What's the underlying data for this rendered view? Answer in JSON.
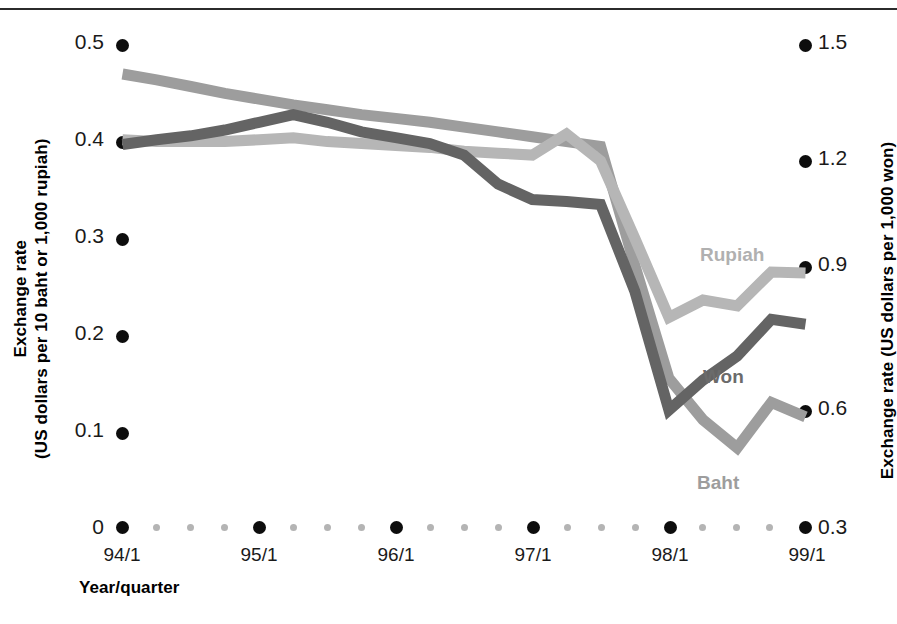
{
  "chart_data": {
    "type": "line",
    "title": "",
    "xlabel": "Year/quarter",
    "ylabel": "Exchange rate\n(US dollars per 10 baht or 1,000 rupiah)",
    "y2label": "Exchange rate (US dollars per 1,000 won)",
    "grid": false,
    "legend_position": "inline-labels",
    "x_tick_labels": [
      "94/1",
      "95/1",
      "96/1",
      "97/1",
      "98/1",
      "99/1"
    ],
    "x_minor_ticks_per_interval": 3,
    "left_axis": {
      "ticks": [
        "0",
        "0.1",
        "0.2",
        "0.3",
        "0.4",
        "0.5"
      ],
      "values": [
        0,
        0.1,
        0.2,
        0.3,
        0.4,
        0.5
      ],
      "ylim": [
        0,
        0.5
      ],
      "units": "US dollars per 10 baht or 1,000 rupiah"
    },
    "right_axis": {
      "ticks": [
        "0.3",
        "0.6",
        "0.9",
        "1.2",
        "1.5"
      ],
      "values": [
        0.3,
        0.6,
        0.9,
        1.2,
        1.5
      ],
      "ylim": [
        0.0,
        1.8
      ],
      "units": "US dollars per 1,000 won"
    },
    "x": [
      "94/1",
      "94/2",
      "94/3",
      "94/4",
      "95/1",
      "95/2",
      "95/3",
      "95/4",
      "96/1",
      "96/2",
      "96/3",
      "96/4",
      "97/1",
      "97/2",
      "97/3",
      "97/4",
      "98/1",
      "98/2",
      "98/3",
      "98/4",
      "99/1"
    ],
    "series": [
      {
        "name": "Baht",
        "axis": "left",
        "color": "#9d9d9d",
        "values": [
          0.47,
          0.464,
          0.457,
          0.45,
          0.444,
          0.438,
          0.433,
          0.428,
          0.424,
          0.42,
          0.415,
          0.41,
          0.405,
          0.4,
          0.395,
          0.272,
          0.155,
          0.112,
          0.083,
          0.13,
          0.115
        ]
      },
      {
        "name": "Won",
        "axis": "right",
        "color": "#646464",
        "values_left_scale": [
          0.397,
          0.402,
          0.406,
          0.412,
          0.42,
          0.428,
          0.42,
          0.41,
          0.404,
          0.398,
          0.386,
          0.356,
          0.34,
          0.338,
          0.335,
          0.245,
          0.122,
          0.153,
          0.178,
          0.216,
          0.211
        ],
        "values": [
          1.191,
          1.206,
          1.218,
          1.236,
          1.26,
          1.284,
          1.26,
          1.23,
          1.212,
          1.194,
          1.158,
          1.068,
          1.02,
          1.014,
          1.005,
          0.735,
          0.366,
          0.459,
          0.534,
          0.648,
          0.633
        ]
      },
      {
        "name": "Rupiah",
        "axis": "left",
        "color": "#b6b6b6",
        "values": [
          0.402,
          0.4,
          0.4,
          0.4,
          0.402,
          0.404,
          0.4,
          0.398,
          0.396,
          0.394,
          0.39,
          0.388,
          0.386,
          0.408,
          0.38,
          0.3,
          0.218,
          0.236,
          0.23,
          0.265,
          0.264
        ]
      }
    ],
    "series_labels": [
      {
        "name": "Rupiah",
        "color": "#b0b0b0"
      },
      {
        "name": "Won",
        "color": "#6b6b6b"
      },
      {
        "name": "Baht",
        "color": "#9d9d9d"
      }
    ]
  },
  "axis_titles": {
    "left_line1": "Exchange rate",
    "left_line2": "(US dollars per 10 baht or 1,000 rupiah)",
    "right": "Exchange rate (US dollars per 1,000 won)",
    "bottom": "Year/quarter"
  },
  "left_ticks": [
    "0.5",
    "0.4",
    "0.3",
    "0.2",
    "0.1",
    "0"
  ],
  "right_ticks": [
    "1.5",
    "1.2",
    "0.9",
    "0.6",
    "0.3"
  ],
  "x_ticks": [
    "94/1",
    "95/1",
    "96/1",
    "97/1",
    "98/1",
    "99/1"
  ],
  "series_names": {
    "rupiah": "Rupiah",
    "won": "Won",
    "baht": "Baht"
  }
}
